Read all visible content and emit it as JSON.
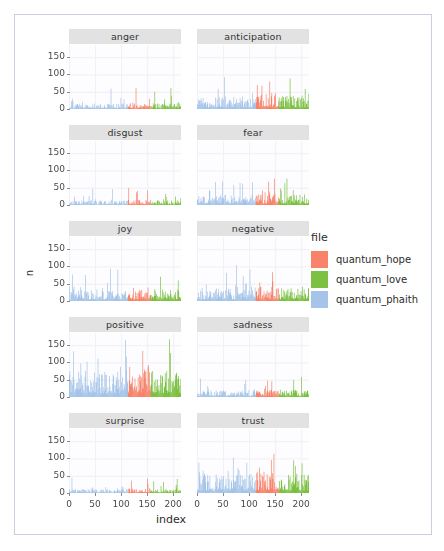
{
  "chart_data": {
    "type": "bar",
    "title": "",
    "xlabel": "index",
    "ylabel": "n",
    "xlim": [
      0,
      215
    ],
    "ylim": [
      0,
      185
    ],
    "xticks": [
      0,
      50,
      100,
      150,
      200
    ],
    "yticks": [
      0,
      50,
      100,
      150
    ],
    "grid": true,
    "legend": {
      "title": "file",
      "position": "right",
      "entries": [
        {
          "name": "quantum_hope",
          "color": "#F8836A"
        },
        {
          "name": "quantum_love",
          "color": "#7CC142"
        },
        {
          "name": "quantum_phaith",
          "color": "#A5C4E8"
        }
      ]
    },
    "series_ranges": [
      {
        "name": "quantum_phaith",
        "index_from": 0,
        "index_to": 112
      },
      {
        "name": "quantum_hope",
        "index_from": 113,
        "index_to": 156
      },
      {
        "name": "quantum_love",
        "index_from": 157,
        "index_to": 215
      }
    ],
    "facet_variable": "sentiment",
    "facets": [
      {
        "label": "anger",
        "max_n": 62,
        "mean_n": 11
      },
      {
        "label": "anticipation",
        "label_max": 100,
        "max_n": 100,
        "mean_n": 26
      },
      {
        "label": "disgust",
        "max_n": 50,
        "mean_n": 9
      },
      {
        "label": "fear",
        "max_n": 78,
        "mean_n": 20
      },
      {
        "label": "joy",
        "max_n": 95,
        "mean_n": 24
      },
      {
        "label": "negative",
        "max_n": 105,
        "mean_n": 25
      },
      {
        "label": "positive",
        "max_n": 182,
        "mean_n": 55
      },
      {
        "label": "sadness",
        "max_n": 58,
        "mean_n": 14
      },
      {
        "label": "surprise",
        "max_n": 44,
        "mean_n": 8
      },
      {
        "label": "trust",
        "max_n": 128,
        "mean_n": 38
      }
    ]
  }
}
